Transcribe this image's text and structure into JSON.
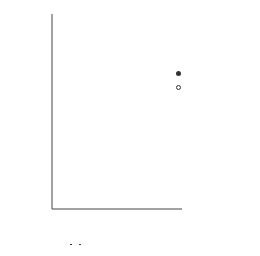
{
  "chart_data": {
    "type": "scatter",
    "title": "",
    "xlabel": "√t (√min)",
    "ylabel": "y_L (mm)",
    "xlim": [
      0,
      7
    ],
    "ylim": [
      0,
      250
    ],
    "grid": true,
    "legend_position": "right",
    "x_ticks": [
      "0",
      "2",
      "4",
      "6"
    ],
    "y_ticks": [
      "0",
      "40",
      "80",
      "120",
      "160",
      "200"
    ],
    "series": [
      {
        "name": "Thermocouple",
        "marker": "filled-circle",
        "x": [
          2.8,
          6.4
        ],
        "y": [
          68,
          146
        ]
      },
      {
        "name": "Tracer element",
        "marker": "open-circle",
        "x": [
          2.0,
          2.8,
          5.4
        ],
        "y": [
          52,
          74,
          126
        ]
      }
    ],
    "fit_line": {
      "x": [
        0.5,
        6.8
      ],
      "y": [
        20,
        160
      ]
    }
  },
  "axes": {
    "ylabel_main": "y",
    "ylabel_sub": "L",
    "ylabel_unit": "(mm)",
    "xlabel_sqrt": "√",
    "xlabel_var": "t",
    "xlabel_unit_open": "(",
    "xlabel_unit_sqrt": "√",
    "xlabel_unit": "min",
    "xlabel_unit_close": ")"
  },
  "legend": {
    "items": [
      {
        "label": "Thermocouple",
        "color": "#333333"
      },
      {
        "label": "Tracer element",
        "color": "#333333"
      }
    ]
  }
}
